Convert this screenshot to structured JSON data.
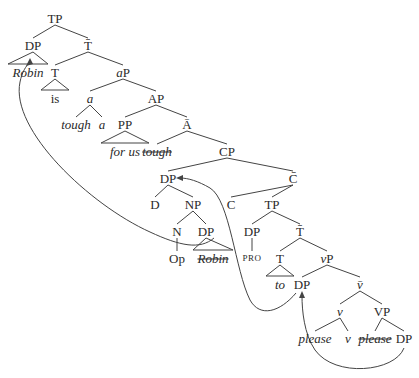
{
  "diagram": {
    "type": "syntax-tree",
    "nodes": [
      {
        "id": "tp_root",
        "label": "TP",
        "x": 55,
        "y": 18
      },
      {
        "id": "dp_subj",
        "label": "DP",
        "x": 33,
        "y": 45
      },
      {
        "id": "tbar",
        "label": "T̄",
        "x": 88,
        "y": 45
      },
      {
        "id": "robin",
        "label": "Robin",
        "x": 28,
        "y": 72,
        "style": "it"
      },
      {
        "id": "t_is",
        "label": "T",
        "x": 55,
        "y": 72
      },
      {
        "id": "ap_small",
        "label": "aP",
        "x": 123,
        "y": 72,
        "style": "it-first"
      },
      {
        "id": "is",
        "label": "is",
        "x": 55,
        "y": 98
      },
      {
        "id": "a_head",
        "label": "a",
        "x": 90,
        "y": 98,
        "style": "it"
      },
      {
        "id": "AP",
        "label": "AP",
        "x": 156,
        "y": 98
      },
      {
        "id": "tough",
        "label": "tough",
        "x": 76,
        "y": 124,
        "style": "it"
      },
      {
        "id": "a_leaf",
        "label": "a",
        "x": 102,
        "y": 124,
        "style": "it"
      },
      {
        "id": "PP",
        "label": "PP",
        "x": 125,
        "y": 124
      },
      {
        "id": "abar",
        "label": "Ā",
        "x": 187,
        "y": 124
      },
      {
        "id": "for_us",
        "label": "for us",
        "x": 125,
        "y": 151,
        "style": "it"
      },
      {
        "id": "tough_copy",
        "label": "tough",
        "x": 157,
        "y": 151,
        "style": "it strike"
      },
      {
        "id": "CP",
        "label": "CP",
        "x": 227,
        "y": 151
      },
      {
        "id": "dp_op",
        "label": "DP",
        "x": 168,
        "y": 178
      },
      {
        "id": "cbar",
        "label": "C̄",
        "x": 293,
        "y": 178
      },
      {
        "id": "D",
        "label": "D",
        "x": 155,
        "y": 204
      },
      {
        "id": "NP",
        "label": "NP",
        "x": 193,
        "y": 204
      },
      {
        "id": "C",
        "label": "C",
        "x": 231,
        "y": 204
      },
      {
        "id": "tp_emb",
        "label": "TP",
        "x": 272,
        "y": 204
      },
      {
        "id": "N",
        "label": "N",
        "x": 177,
        "y": 231
      },
      {
        "id": "dp_robin",
        "label": "DP",
        "x": 206,
        "y": 231
      },
      {
        "id": "dp_pro",
        "label": "DP",
        "x": 252,
        "y": 231
      },
      {
        "id": "tbar_emb",
        "label": "T̄",
        "x": 300,
        "y": 231
      },
      {
        "id": "Op",
        "label": "Op",
        "x": 177,
        "y": 258
      },
      {
        "id": "robin_copy",
        "label": "Robin",
        "x": 213,
        "y": 258,
        "style": "it strike"
      },
      {
        "id": "PRO",
        "label": "PRO",
        "x": 252,
        "y": 258,
        "style": "sc"
      },
      {
        "id": "t_to",
        "label": "T",
        "x": 280,
        "y": 258
      },
      {
        "id": "vP",
        "label": "vP",
        "x": 327,
        "y": 258,
        "style": "it-first"
      },
      {
        "id": "to",
        "label": "to",
        "x": 280,
        "y": 284,
        "style": "it"
      },
      {
        "id": "dp_spec_v",
        "label": "DP",
        "x": 302,
        "y": 284
      },
      {
        "id": "vbar",
        "label": "v̄",
        "x": 360,
        "y": 284,
        "style": "it"
      },
      {
        "id": "v_head",
        "label": "v",
        "x": 340,
        "y": 311,
        "style": "it"
      },
      {
        "id": "VP",
        "label": "VP",
        "x": 382,
        "y": 311
      },
      {
        "id": "please",
        "label": "please",
        "x": 315,
        "y": 338,
        "style": "it"
      },
      {
        "id": "v_leaf",
        "label": "v",
        "x": 348,
        "y": 338,
        "style": "it"
      },
      {
        "id": "please_copy",
        "label": "please",
        "x": 375,
        "y": 338,
        "style": "it strike"
      },
      {
        "id": "dp_obj",
        "label": "DP",
        "x": 404,
        "y": 338
      }
    ],
    "edges": [
      [
        "tp_root",
        "dp_subj"
      ],
      [
        "tp_root",
        "tbar"
      ],
      [
        "tbar",
        "t_is"
      ],
      [
        "tbar",
        "ap_small"
      ],
      [
        "ap_small",
        "a_head"
      ],
      [
        "ap_small",
        "AP"
      ],
      [
        "a_head",
        "tough"
      ],
      [
        "a_head",
        "a_leaf"
      ],
      [
        "AP",
        "PP"
      ],
      [
        "AP",
        "abar"
      ],
      [
        "abar",
        "tough_copy"
      ],
      [
        "abar",
        "CP"
      ],
      [
        "CP",
        "dp_op"
      ],
      [
        "CP",
        "cbar"
      ],
      [
        "dp_op",
        "D"
      ],
      [
        "dp_op",
        "NP"
      ],
      [
        "NP",
        "N"
      ],
      [
        "NP",
        "dp_robin"
      ],
      [
        "N",
        "Op"
      ],
      [
        "cbar",
        "C"
      ],
      [
        "cbar",
        "tp_emb"
      ],
      [
        "tp_emb",
        "dp_pro"
      ],
      [
        "tp_emb",
        "tbar_emb"
      ],
      [
        "dp_pro",
        "PRO"
      ],
      [
        "tbar_emb",
        "t_to"
      ],
      [
        "tbar_emb",
        "vP"
      ],
      [
        "vP",
        "dp_spec_v"
      ],
      [
        "vP",
        "vbar"
      ],
      [
        "vbar",
        "v_head"
      ],
      [
        "vbar",
        "VP"
      ],
      [
        "v_head",
        "please"
      ],
      [
        "v_head",
        "v_leaf"
      ],
      [
        "VP",
        "please_copy"
      ],
      [
        "VP",
        "dp_obj"
      ]
    ],
    "triangles": [
      {
        "apex": "dp_subj",
        "over": "robin"
      },
      {
        "apex": "t_is",
        "over": "is"
      },
      {
        "apex": "PP",
        "over": "for_us"
      },
      {
        "apex": "dp_robin",
        "over": "robin_copy"
      },
      {
        "apex": "t_to",
        "over": "to"
      }
    ],
    "movement_arrows": [
      {
        "from": "dp_robin",
        "to": "dp_subj",
        "description": "Robin moves from inside NP to matrix Spec,TP"
      },
      {
        "from": "dp_spec_v",
        "to": "dp_op",
        "description": "operator DP moves to Spec,CP"
      },
      {
        "from": "dp_obj",
        "to": "dp_spec_v",
        "description": "object DP moves to Spec,vP"
      }
    ]
  }
}
